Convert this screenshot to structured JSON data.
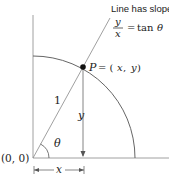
{
  "diagram": {
    "title_cut": "Unit circle with point P and slope line",
    "annotation": {
      "line1": "Line has slope",
      "frac_num": "y",
      "frac_den": "x",
      "rhs_eq": "=",
      "rhs_fn": "tan",
      "rhs_var": "θ"
    },
    "point_label": {
      "name": "P",
      "eq": "= (",
      "x": "x",
      "comma": ", ",
      "y": "y",
      "close": ")"
    },
    "labels": {
      "hypotenuse": "1",
      "vertical": "y",
      "angle": "θ",
      "origin": "(0, 0)",
      "horizontal": "x"
    },
    "colors": {
      "stroke": "#555555",
      "arc": "#666666",
      "point": "#111111",
      "text": "#222222"
    }
  }
}
